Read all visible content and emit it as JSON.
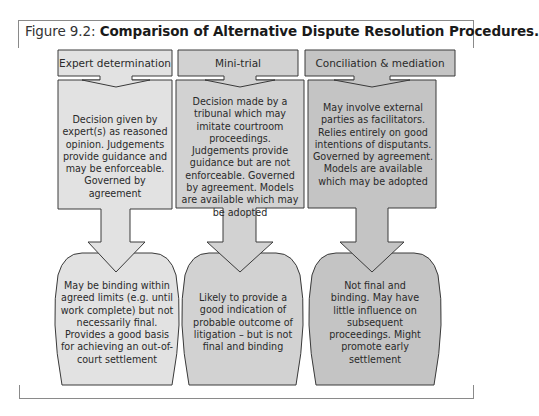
{
  "figure": {
    "label": "Figure 9.2:",
    "title": "Comparison of Alternative Dispute Resolution Procedures."
  },
  "colors": {
    "col1_fill": "#e2e2e2",
    "col2_fill": "#d2d2d2",
    "col3_fill": "#c4c4c4",
    "stroke": "#3a3a3a",
    "frame": "#8a8a8a"
  },
  "columns": [
    {
      "header": "Expert determination",
      "description": "Decision given by expert(s) as reasoned opinion. Judgements provide guidance and may be enforceable. Governed by agreement",
      "outcome": "May be binding within agreed limits (e.g. until work complete) but not necessarily final. Provides a good basis for achieving an out-of-court settlement"
    },
    {
      "header": "Mini-trial",
      "description": "Decision made by a tribunal which may imitate courtroom proceedings. Judgements provide guidance but are not enforceable. Governed by agreement. Models are available which may be adopted",
      "outcome": "Likely to provide a good indication of probable outcome of litigation – but is not final and binding"
    },
    {
      "header": "Conciliation & mediation",
      "description": "May involve external parties as facilitators. Relies entirely on good intentions of disputants. Governed by agreement. Models are available which may be adopted",
      "outcome": "Not final and binding. May have little influence on subsequent proceedings. Might promote early settlement"
    }
  ]
}
